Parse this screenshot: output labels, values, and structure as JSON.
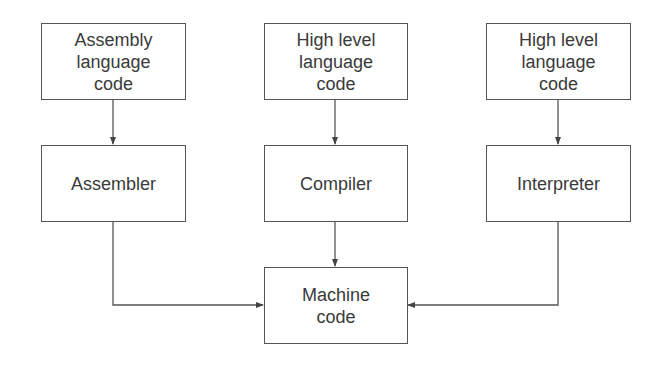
{
  "diagram": {
    "sources": [
      {
        "id": "assembly",
        "label": "Assembly\nlanguage\ncode"
      },
      {
        "id": "hll1",
        "label": "High level\nlanguage\ncode"
      },
      {
        "id": "hll2",
        "label": "High level\nlanguage\ncode"
      }
    ],
    "translators": [
      {
        "id": "assembler",
        "label": "Assembler"
      },
      {
        "id": "compiler",
        "label": "Compiler"
      },
      {
        "id": "interpreter",
        "label": "Interpreter"
      }
    ],
    "target": {
      "id": "machine",
      "label": "Machine\ncode"
    },
    "edges": [
      {
        "from": "assembly",
        "to": "assembler"
      },
      {
        "from": "hll1",
        "to": "compiler"
      },
      {
        "from": "hll2",
        "to": "interpreter"
      },
      {
        "from": "assembler",
        "to": "machine"
      },
      {
        "from": "compiler",
        "to": "machine"
      },
      {
        "from": "interpreter",
        "to": "machine"
      }
    ],
    "colors": {
      "stroke": "#555555",
      "text": "#3a3a3a",
      "background": "#ffffff"
    }
  }
}
